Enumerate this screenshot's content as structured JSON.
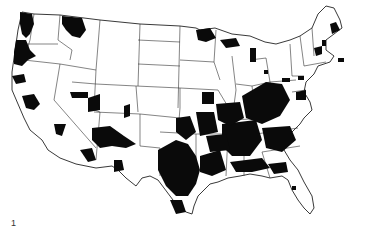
{
  "figure": {
    "label": "1",
    "colors": {
      "background": "#ffffff",
      "shade": "#0a0a0a",
      "lines": "#333333"
    }
  },
  "map": {
    "outline": "M22,12 L34,14 L60,15 L100,20 L140,24 L180,26 L196,28 L200,30 L215,28 L232,34 L250,36 L265,42 L276,44 L290,40 L300,36 L312,28 L318,14 L326,6 L334,8 L340,20 L342,28 L334,34 L326,40 L326,50 L334,56 L330,62 L318,66 L314,74 L306,82 L304,92 L310,102 L312,110 L304,118 L300,124 L292,132 L286,140 L284,150 L290,160 L298,170 L304,182 L312,196 L314,208 L310,214 L304,208 L298,200 L292,190 L288,180 L282,176 L270,178 L262,176 L250,174 L240,176 L228,178 L218,182 L210,184 L204,190 L198,196 L194,206 L192,214 L186,212 L176,204 L170,196 L164,188 L158,180 L150,176 L142,178 L136,186 L126,178 L118,170 L112,166 L96,168 L86,166 L76,164 L60,158 L48,150 L42,140 L30,130 L24,118 L18,104 L12,90 L12,72 L14,58 L16,44 L18,30 Z",
    "borders": [
      "M34,14 L30,40 L24,60",
      "M24,60 L60,64 L96,70",
      "M60,15 L58,40 L72,50 L70,60",
      "M22,44 L58,44",
      "M96,70 L94,110 L100,112",
      "M60,64 L54,100 L96,148",
      "M72,82 L96,84",
      "M100,20 L96,70",
      "M96,84 L136,86 L138,112",
      "M94,112 L140,114 L140,146",
      "M100,112 L96,160",
      "M140,24 L138,86",
      "M138,40 L180,42",
      "M138,64 L180,66",
      "M136,86 L180,88 L180,108",
      "M140,114 L160,116 L180,118",
      "M140,146 L160,148 L160,176",
      "M180,26 L178,108",
      "M180,108 L178,132",
      "M160,132 L196,134",
      "M180,60 L214,62 L220,80",
      "M180,88 L218,90",
      "M196,134 L196,176",
      "M214,62 L216,30",
      "M218,90 L230,110 L228,134",
      "M196,134 L228,134 L232,150",
      "M228,134 L226,176",
      "M232,56 L236,90 L232,120",
      "M236,84 L252,86 L256,118",
      "M232,120 L270,118",
      "M250,60 L266,58 L270,82",
      "M252,86 L270,82",
      "M270,82 L296,80",
      "M270,82 L274,104 L260,118",
      "M256,134 L298,128",
      "M244,134 L244,176",
      "M262,152 L300,146",
      "M262,152 L270,178",
      "M290,44 L292,76 L304,76",
      "M300,36 L304,66",
      "M312,28 L314,56",
      "M304,66 L326,62",
      "M292,92 L306,90"
    ],
    "shaded_regions": [
      {
        "name": "washington-west",
        "d": "M20,12 L32,14 L34,24 L30,34 L26,38 L22,34 L20,24 Z"
      },
      {
        "name": "oregon-west",
        "d": "M16,40 L26,40 L30,50 L36,56 L28,60 L22,66 L14,64 L14,52 Z"
      },
      {
        "name": "montana-nw",
        "d": "M62,16 L82,18 L86,30 L80,38 L72,36 L66,30 L62,24 Z"
      },
      {
        "name": "california-north",
        "d": "M12,76 L24,74 L26,82 L16,84 Z"
      },
      {
        "name": "nevada-central",
        "d": "M22,96 L34,94 L40,104 L34,110 L26,108 Z"
      },
      {
        "name": "utah-north",
        "d": "M70,92 L88,92 L88,98 L72,98 Z"
      },
      {
        "name": "wyoming-sw",
        "d": "M88,98 L100,94 L100,110 L88,112 Z"
      },
      {
        "name": "colorado-dot",
        "d": "M124,106 L130,104 L130,116 L124,118 Z"
      },
      {
        "name": "arizona-nw",
        "d": "M54,124 L66,124 L62,136 L56,134 Z"
      },
      {
        "name": "four-corners",
        "d": "M92,128 L110,126 L124,136 L136,144 L126,148 L112,146 L100,148 L92,140 Z"
      },
      {
        "name": "arizona-se",
        "d": "M80,150 L92,148 L96,160 L88,162 Z"
      },
      {
        "name": "new-mexico-south",
        "d": "M114,160 L122,160 L124,170 L114,172 Z"
      },
      {
        "name": "texas-east",
        "d": "M158,150 L176,140 L188,144 L196,156 L200,170 L196,184 L188,196 L176,196 L166,186 L158,170 Z"
      },
      {
        "name": "texas-south",
        "d": "M170,200 L182,200 L186,212 L176,214 Z"
      },
      {
        "name": "oklahoma-east",
        "d": "M176,118 L190,116 L196,132 L186,140 L176,132 Z"
      },
      {
        "name": "arkansas",
        "d": "M196,112 L214,112 L218,132 L200,136 Z"
      },
      {
        "name": "louisiana",
        "d": "M200,156 L220,150 L226,170 L212,176 L200,172 Z"
      },
      {
        "name": "mississippi-alabama",
        "d": "M222,124 L256,120 L262,140 L250,156 L232,156 L222,146 Z"
      },
      {
        "name": "appalachia",
        "d": "M242,96 L266,82 L282,84 L290,100 L280,116 L262,124 L246,118 Z"
      },
      {
        "name": "tennessee-kentucky",
        "d": "M216,104 L240,102 L244,118 L230,126 L218,120 Z"
      },
      {
        "name": "georgia-carolina",
        "d": "M262,128 L290,126 L296,140 L282,152 L266,148 Z"
      },
      {
        "name": "gulf-coast",
        "d": "M230,162 L262,158 L270,168 L252,172 L236,172 Z"
      },
      {
        "name": "florida-panhandle",
        "d": "M268,164 L286,162 L288,172 L274,174 Z"
      },
      {
        "name": "florida-dot",
        "d": "M292,186 L296,186 L296,190 L292,190 Z"
      },
      {
        "name": "missouri-east",
        "d": "M202,92 L214,92 L214,104 L202,104 Z"
      },
      {
        "name": "minnesota-north",
        "d": "M196,30 L210,28 L216,38 L206,42 L198,40 Z"
      },
      {
        "name": "michigan-up",
        "d": "M220,40 L236,38 L240,46 L226,48 Z"
      },
      {
        "name": "michigan-lower",
        "d": "M250,48 L256,48 L256,62 L250,62 Z"
      },
      {
        "name": "michigan-dot",
        "d": "M264,70 L268,70 L268,74 L264,74 Z"
      },
      {
        "name": "pennsylvania-a",
        "d": "M282,78 L290,78 L290,82 L282,82 Z"
      },
      {
        "name": "pennsylvania-b",
        "d": "M298,76 L304,76 L304,80 L298,80 Z"
      },
      {
        "name": "new-york-central",
        "d": "M314,48 L322,46 L322,54 L316,56 Z"
      },
      {
        "name": "maine-east",
        "d": "M330,24 L336,22 L340,30 L332,34 Z"
      },
      {
        "name": "vermont",
        "d": "M322,40 L326,40 L326,46 L322,46 Z"
      },
      {
        "name": "new-england-coast",
        "d": "M338,58 L344,58 L344,62 L338,62 Z"
      },
      {
        "name": "virginia-east",
        "d": "M296,92 L306,90 L306,100 L296,100 Z"
      },
      {
        "name": "mid-south-block",
        "d": "M206,136 L226,134 L230,150 L210,152 Z"
      }
    ]
  }
}
